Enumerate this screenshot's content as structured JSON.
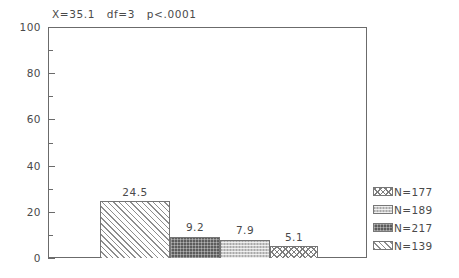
{
  "chart_data": {
    "type": "bar",
    "title": "X=35.1   df=3   p<.0001",
    "xlabel": "",
    "ylabel": "",
    "ylim": [
      0,
      100
    ],
    "y_major_ticks": [
      0,
      20,
      40,
      60,
      80,
      100
    ],
    "y_minor_ticks": [
      10,
      30,
      50,
      70,
      90
    ],
    "y_tick_labels": [
      "0",
      "20",
      "40",
      "60",
      "80",
      "100"
    ],
    "grid": false,
    "legend_position": "right-bottom",
    "categories": [
      "N=177",
      "N=189",
      "N=217",
      "N=139"
    ],
    "values": [
      24.5,
      9.2,
      7.9,
      5.1
    ],
    "data_labels": [
      "24.5",
      "9.2",
      "7.9",
      "5.1"
    ],
    "series": [
      {
        "name": "percent",
        "values": [
          24.5,
          9.2,
          7.9,
          5.1
        ]
      }
    ],
    "bar_fills": [
      "diagonal-hatch-light",
      "dark-dotted",
      "light-dotted",
      "checkered-hatch"
    ],
    "annotations": [
      "X=35.1",
      "df=3",
      "p<.0001"
    ]
  },
  "title": {
    "text": "X=35.1   df=3   p<.0001"
  },
  "y_axis": {
    "labels": [
      {
        "text": "100",
        "value": 100
      },
      {
        "text": "80",
        "value": 80
      },
      {
        "text": "60",
        "value": 60
      },
      {
        "text": "40",
        "value": 40
      },
      {
        "text": "20",
        "value": 20
      },
      {
        "text": "0",
        "value": 0
      }
    ]
  },
  "bars": [
    {
      "label": "24.5",
      "value": 24.5,
      "fill": "diagonal-hatch-light"
    },
    {
      "label": "9.2",
      "value": 9.2,
      "fill": "dark-dotted"
    },
    {
      "label": "7.9",
      "value": 7.9,
      "fill": "light-dotted"
    },
    {
      "label": "5.1",
      "value": 5.1,
      "fill": "checkered-hatch"
    }
  ],
  "legend": {
    "items": [
      {
        "label": "N=177",
        "fill": "checkered-hatch"
      },
      {
        "label": "N=189",
        "fill": "light-dotted"
      },
      {
        "label": "N=217",
        "fill": "dark-dotted"
      },
      {
        "label": "N=139",
        "fill": "diagonal-hatch-light"
      }
    ]
  },
  "colors": {
    "axis": "#6b6b6b",
    "text": "#4a4a4a",
    "bar_border": "#757575",
    "background": "#ffffff",
    "dark_fill": "#5c5c5c",
    "light_fill": "#c8c8c8"
  }
}
